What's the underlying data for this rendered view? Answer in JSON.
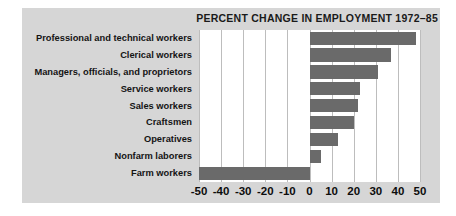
{
  "chart_data": {
    "type": "bar",
    "orientation": "horizontal",
    "title": "PERCENT CHANGE IN EMPLOYMENT 1972–85",
    "xlabel": "",
    "ylabel": "",
    "categories": [
      "Professional and technical workers",
      "Clerical workers",
      "Managers, officials, and proprietors",
      "Service workers",
      "Sales workers",
      "Craftsmen",
      "Operatives",
      "Nonfarm laborers",
      "Farm workers"
    ],
    "values": [
      48,
      37,
      31,
      23,
      22,
      20,
      13,
      5,
      -50
    ],
    "xlim": [
      -50,
      50
    ],
    "xticks": [
      -50,
      -40,
      -30,
      -20,
      -10,
      0,
      10,
      20,
      30,
      40,
      50
    ],
    "xtick_labels": [
      "-50",
      "-40",
      "-30",
      "-20",
      "-10",
      "0",
      "10",
      "20",
      "30",
      "40",
      "50"
    ],
    "grid": "vertical",
    "legend": "none",
    "bar_color": "#6a6a6a",
    "plot_background": "#ffffff",
    "panel_background": "#d6d6d6",
    "gridline_color": "#bdbdbd",
    "text_color": "#141414"
  }
}
